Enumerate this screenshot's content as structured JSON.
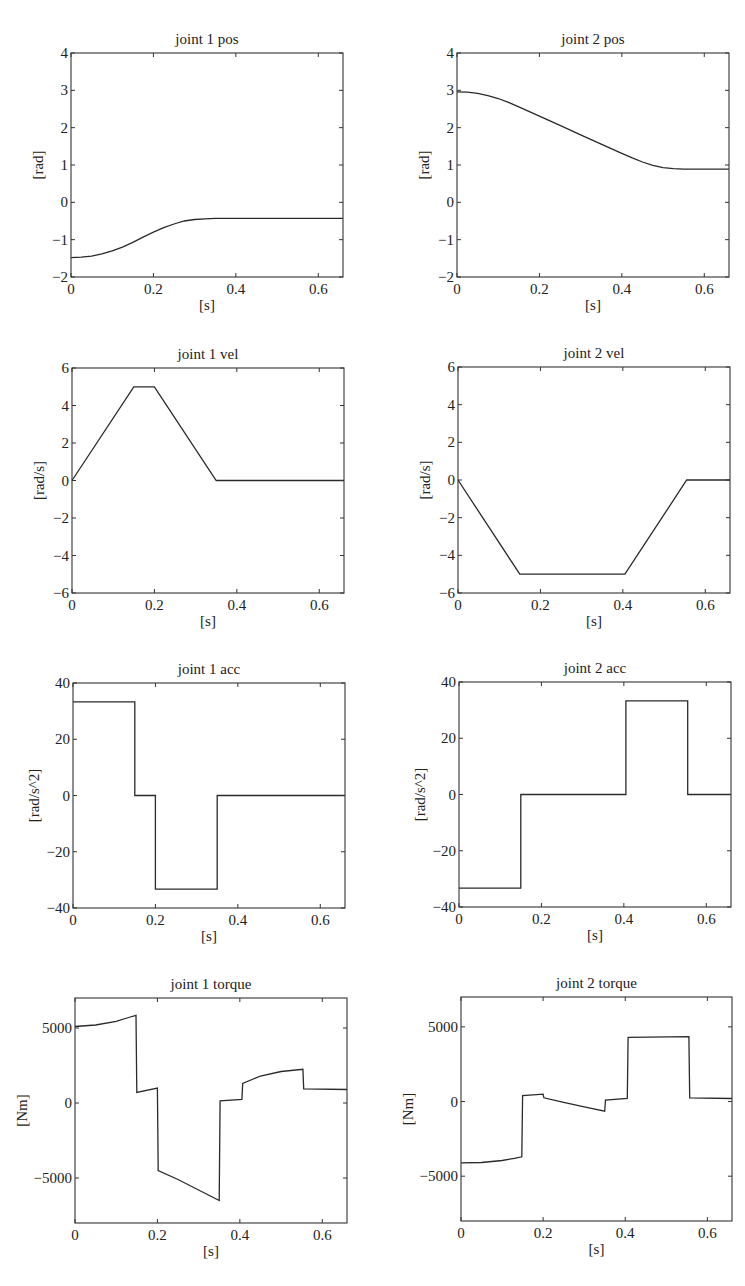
{
  "figure": {
    "background": "#ffffff",
    "line_color": "#2a2a2a",
    "axes_color": "#333333"
  },
  "chart_data": [
    {
      "id": "joint1-pos",
      "type": "line",
      "title": "joint 1 pos",
      "xlabel": "[s]",
      "ylabel": "[rad]",
      "xlim": [
        0,
        0.66
      ],
      "ylim": [
        -2,
        4
      ],
      "xticks": [
        0,
        0.2,
        0.4,
        0.6
      ],
      "xtick_labels": [
        "0",
        "0.2",
        "0.4",
        "0.6"
      ],
      "yticks": [
        -2,
        -1,
        0,
        1,
        2,
        3,
        4
      ],
      "ytick_labels": [
        "−2",
        "−1",
        "0",
        "1",
        "2",
        "3",
        "4"
      ],
      "grid": false,
      "box": {
        "left": 71,
        "top": 53,
        "right": 343,
        "bottom": 277
      },
      "series": [
        {
          "name": "joint 1 pos",
          "x": [
            0,
            0.025,
            0.05,
            0.075,
            0.1,
            0.125,
            0.15,
            0.175,
            0.2,
            0.225,
            0.25,
            0.275,
            0.3,
            0.325,
            0.35,
            0.4,
            0.5,
            0.66
          ],
          "y": [
            -1.48,
            -1.47,
            -1.44,
            -1.38,
            -1.3,
            -1.2,
            -1.07,
            -0.93,
            -0.8,
            -0.68,
            -0.58,
            -0.5,
            -0.46,
            -0.44,
            -0.43,
            -0.43,
            -0.43,
            -0.43
          ]
        }
      ]
    },
    {
      "id": "joint2-pos",
      "type": "line",
      "title": "joint 2 pos",
      "xlabel": "[s]",
      "ylabel": "[rad]",
      "xlim": [
        0,
        0.66
      ],
      "ylim": [
        -2,
        4
      ],
      "xticks": [
        0,
        0.2,
        0.4,
        0.6
      ],
      "xtick_labels": [
        "0",
        "0.2",
        "0.4",
        "0.6"
      ],
      "yticks": [
        -2,
        -1,
        0,
        1,
        2,
        3,
        4
      ],
      "ytick_labels": [
        "−2",
        "−1",
        "0",
        "1",
        "2",
        "3",
        "4"
      ],
      "grid": false,
      "box": {
        "left": 457,
        "top": 53,
        "right": 729,
        "bottom": 277
      },
      "series": [
        {
          "name": "joint 2 pos",
          "x": [
            0,
            0.025,
            0.05,
            0.075,
            0.1,
            0.125,
            0.15,
            0.2,
            0.25,
            0.3,
            0.35,
            0.4,
            0.425,
            0.45,
            0.475,
            0.5,
            0.525,
            0.55,
            0.6,
            0.66
          ],
          "y": [
            2.96,
            2.95,
            2.92,
            2.86,
            2.78,
            2.68,
            2.56,
            2.31,
            2.06,
            1.81,
            1.56,
            1.31,
            1.19,
            1.08,
            0.99,
            0.93,
            0.9,
            0.89,
            0.89,
            0.89
          ]
        }
      ]
    },
    {
      "id": "joint1-vel",
      "type": "line",
      "title": "joint 1 vel",
      "xlabel": "[s]",
      "ylabel": "[rad/s]",
      "xlim": [
        0,
        0.66
      ],
      "ylim": [
        -6,
        6
      ],
      "xticks": [
        0,
        0.2,
        0.4,
        0.6
      ],
      "xtick_labels": [
        "0",
        "0.2",
        "0.4",
        "0.6"
      ],
      "yticks": [
        -6,
        -4,
        -2,
        0,
        2,
        4,
        6
      ],
      "ytick_labels": [
        "−6",
        "−4",
        "−2",
        "0",
        "2",
        "4",
        "6"
      ],
      "grid": false,
      "box": {
        "left": 72,
        "top": 368,
        "right": 344,
        "bottom": 593
      },
      "series": [
        {
          "name": "joint 1 vel",
          "x": [
            0,
            0.15,
            0.2,
            0.35,
            0.66
          ],
          "y": [
            0,
            5,
            5,
            0,
            0
          ]
        }
      ]
    },
    {
      "id": "joint2-vel",
      "type": "line",
      "title": "joint 2 vel",
      "xlabel": "[s]",
      "ylabel": "[rad/s]",
      "xlim": [
        0,
        0.66
      ],
      "ylim": [
        -6,
        6
      ],
      "xticks": [
        0,
        0.2,
        0.4,
        0.6
      ],
      "xtick_labels": [
        "0",
        "0.2",
        "0.4",
        "0.6"
      ],
      "yticks": [
        -6,
        -4,
        -2,
        0,
        2,
        4,
        6
      ],
      "ytick_labels": [
        "−6",
        "−4",
        "−2",
        "0",
        "2",
        "4",
        "6"
      ],
      "grid": false,
      "box": {
        "left": 458,
        "top": 367,
        "right": 730,
        "bottom": 593
      },
      "series": [
        {
          "name": "joint 2 vel",
          "x": [
            0,
            0.15,
            0.405,
            0.555,
            0.66
          ],
          "y": [
            0,
            -5,
            -5,
            0,
            0
          ]
        }
      ]
    },
    {
      "id": "joint1-acc",
      "type": "line",
      "title": "joint 1 acc",
      "xlabel": "[s]",
      "ylabel": "[rad/s^2]",
      "xlim": [
        0,
        0.66
      ],
      "ylim": [
        -40,
        40
      ],
      "xticks": [
        0,
        0.2,
        0.4,
        0.6
      ],
      "xtick_labels": [
        "0",
        "0.2",
        "0.4",
        "0.6"
      ],
      "yticks": [
        -40,
        -20,
        0,
        20,
        40
      ],
      "ytick_labels": [
        "−40",
        "−20",
        "0",
        "20",
        "40"
      ],
      "grid": false,
      "box": {
        "left": 73,
        "top": 683,
        "right": 345,
        "bottom": 908
      },
      "series": [
        {
          "name": "joint 1 acc",
          "x": [
            0,
            0.15,
            0.15,
            0.2,
            0.2,
            0.35,
            0.35,
            0.66
          ],
          "y": [
            33.3,
            33.3,
            0,
            0,
            -33.3,
            -33.3,
            0,
            0
          ]
        }
      ]
    },
    {
      "id": "joint2-acc",
      "type": "line",
      "title": "joint 2 acc",
      "xlabel": "[s]",
      "ylabel": "[rad/s^2]",
      "xlim": [
        0,
        0.66
      ],
      "ylim": [
        -40,
        40
      ],
      "xticks": [
        0,
        0.2,
        0.4,
        0.6
      ],
      "xtick_labels": [
        "0",
        "0.2",
        "0.4",
        "0.6"
      ],
      "yticks": [
        -40,
        -20,
        0,
        20,
        40
      ],
      "ytick_labels": [
        "−40",
        "−20",
        "0",
        "20",
        "40"
      ],
      "grid": false,
      "box": {
        "left": 459,
        "top": 682,
        "right": 731,
        "bottom": 907
      },
      "series": [
        {
          "name": "joint 2 acc",
          "x": [
            0,
            0.15,
            0.15,
            0.405,
            0.405,
            0.555,
            0.555,
            0.66
          ],
          "y": [
            -33.3,
            -33.3,
            0,
            0,
            33.3,
            33.3,
            0,
            0
          ]
        }
      ]
    },
    {
      "id": "joint1-torque",
      "type": "line",
      "title": "joint 1 torque",
      "xlabel": "[s]",
      "ylabel": "[Nm]",
      "xlim": [
        0,
        0.66
      ],
      "ylim": [
        -8000,
        7000
      ],
      "xticks": [
        0,
        0.2,
        0.4,
        0.6
      ],
      "xtick_labels": [
        "0",
        "0.2",
        "0.4",
        "0.6"
      ],
      "yticks": [
        -5000,
        0,
        5000
      ],
      "ytick_labels": [
        "−5000",
        "0",
        "5000"
      ],
      "grid": false,
      "box": {
        "left": 75,
        "top": 998,
        "right": 347,
        "bottom": 1223
      },
      "series": [
        {
          "name": "joint 1 torque",
          "x": [
            0,
            0.05,
            0.1,
            0.13,
            0.148,
            0.15,
            0.2,
            0.202,
            0.25,
            0.3,
            0.35,
            0.352,
            0.405,
            0.407,
            0.45,
            0.5,
            0.553,
            0.555,
            0.66
          ],
          "y": [
            5100,
            5200,
            5450,
            5700,
            5850,
            700,
            1000,
            -4500,
            -5100,
            -5800,
            -6500,
            150,
            250,
            1300,
            1800,
            2100,
            2250,
            950,
            900
          ]
        }
      ]
    },
    {
      "id": "joint2-torque",
      "type": "line",
      "title": "joint 2 torque",
      "xlabel": "[s]",
      "ylabel": "[Nm]",
      "xlim": [
        0,
        0.66
      ],
      "ylim": [
        -8000,
        7000
      ],
      "xticks": [
        0,
        0.2,
        0.4,
        0.6
      ],
      "xtick_labels": [
        "0",
        "0.2",
        "0.4",
        "0.6"
      ],
      "yticks": [
        -5000,
        0,
        5000
      ],
      "ytick_labels": [
        "−5000",
        "0",
        "5000"
      ],
      "grid": false,
      "box": {
        "left": 461,
        "top": 997,
        "right": 732,
        "bottom": 1221
      },
      "series": [
        {
          "name": "joint 2 torque",
          "x": [
            0,
            0.05,
            0.1,
            0.13,
            0.148,
            0.15,
            0.2,
            0.202,
            0.25,
            0.3,
            0.35,
            0.352,
            0.405,
            0.407,
            0.555,
            0.557,
            0.66
          ],
          "y": [
            -4100,
            -4080,
            -3950,
            -3800,
            -3700,
            400,
            500,
            250,
            -50,
            -350,
            -650,
            100,
            200,
            4300,
            4350,
            250,
            200
          ]
        }
      ]
    }
  ]
}
